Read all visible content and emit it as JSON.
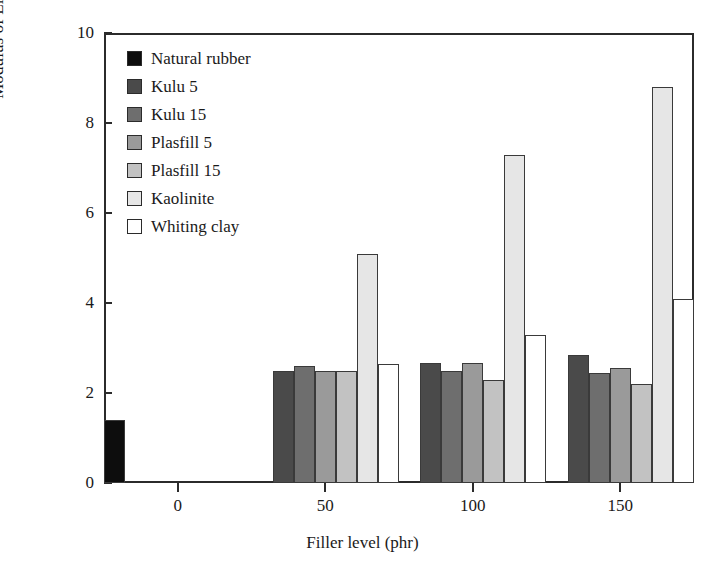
{
  "chart_data": {
    "type": "bar",
    "title": "",
    "xlabel": "Filler level (phr)",
    "ylabel": "Modulus of Elasticity (MPa)",
    "categories": [
      "0",
      "50",
      "100",
      "150"
    ],
    "xtick_labels": [
      "0",
      "50",
      "100",
      "150"
    ],
    "ytick_labels": [
      "0",
      "2",
      "4",
      "6",
      "8",
      "10"
    ],
    "ylim": [
      0,
      10
    ],
    "ytick_step": 2,
    "grid": false,
    "legend_position": "top-left inside",
    "series": [
      {
        "name": "Natural rubber",
        "color": "#0d0d0d",
        "values": [
          1.4,
          null,
          null,
          null
        ]
      },
      {
        "name": "Kulu 5",
        "color": "#4a4a4a",
        "values": [
          null,
          2.5,
          2.67,
          2.85
        ]
      },
      {
        "name": "Kulu 15",
        "color": "#6e6e6e",
        "values": [
          null,
          2.6,
          2.5,
          2.45
        ]
      },
      {
        "name": "Plasfill 5",
        "color": "#9a9a9a",
        "values": [
          null,
          2.5,
          2.67,
          2.55
        ]
      },
      {
        "name": "Plasfill 15",
        "color": "#c2c2c2",
        "values": [
          null,
          2.5,
          2.3,
          2.2
        ]
      },
      {
        "name": "Kaolinite",
        "color": "#e6e6e6",
        "values": [
          null,
          5.1,
          7.3,
          8.8
        ]
      },
      {
        "name": "Whiting clay",
        "color": "#ffffff",
        "values": [
          null,
          2.65,
          3.3,
          4.1
        ]
      }
    ]
  },
  "legend": {
    "items": [
      {
        "label": "Natural rubber"
      },
      {
        "label": "Kulu 5"
      },
      {
        "label": "Kulu 15"
      },
      {
        "label": "Plasfill 5"
      },
      {
        "label": "Plasfill 15"
      },
      {
        "label": "Kaolinite"
      },
      {
        "label": "Whiting clay"
      }
    ]
  }
}
